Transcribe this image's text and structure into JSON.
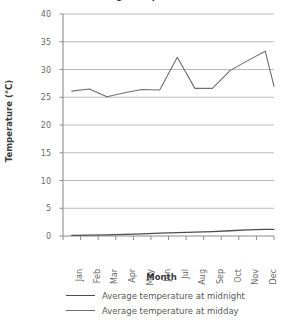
{
  "chart_data": {
    "type": "line",
    "title": "Average temperature",
    "xlabel": "Month",
    "ylabel": "Temperature (°C)",
    "categories": [
      "Jan",
      "Feb",
      "Mar",
      "Apr",
      "May",
      "Jun",
      "Jul",
      "Aug",
      "Sep",
      "Oct",
      "Nov",
      "Dec"
    ],
    "ylim": [
      0,
      40
    ],
    "yticks": [
      0,
      5,
      10,
      15,
      20,
      25,
      30,
      35,
      40
    ],
    "ytick_labels": [
      "0",
      "5",
      "10",
      "15",
      "20",
      "25",
      "30",
      "35",
      "40"
    ],
    "grid": "horizontal",
    "legend_position": "bottom",
    "series": [
      {
        "name": "Average temperature at midnight",
        "color": "#4d4d4d",
        "values": [
          0.1,
          0.15,
          0.2,
          0.3,
          0.4,
          0.5,
          0.6,
          0.7,
          0.8,
          0.95,
          1.1,
          1.2
        ]
      },
      {
        "name": "Average temperature at midday",
        "color": "#6e6e6e",
        "values": [
          26.1,
          26.5,
          25.1,
          25.8,
          26.4,
          26.3,
          32.2,
          26.6,
          26.6,
          29.8,
          31.6,
          33.3
        ]
      }
    ],
    "series_midday_endpoint": 27.0,
    "axis_color": "#8c8c8c",
    "grid_color": "#b3b3b3",
    "text_color": "#6b6b6b"
  },
  "legend": {
    "items": [
      {
        "label": "Average temperature at midnight",
        "color": "#4d4d4d"
      },
      {
        "label": "Average temperature at midday",
        "color": "#6e6e6e"
      }
    ]
  }
}
